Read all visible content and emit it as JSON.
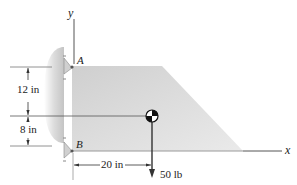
{
  "diagram": {
    "type": "statics-free-body",
    "axes": {
      "x_label": "x",
      "y_label": "y"
    },
    "points": [
      {
        "label": "A",
        "role": "upper-pin-support"
      },
      {
        "label": "B",
        "role": "lower-pin-support"
      }
    ],
    "dimensions": {
      "vertical_upper": "12 in",
      "vertical_lower": "8 in",
      "horizontal_to_centroid": "20 in"
    },
    "load": {
      "label": "50 lb",
      "direction": "down"
    },
    "colors": {
      "plate": "#d9d9d9",
      "plate_shadow": "#bdbdbd",
      "wall": "#e4e4e4",
      "line": "#444444",
      "text": "#222222"
    }
  }
}
